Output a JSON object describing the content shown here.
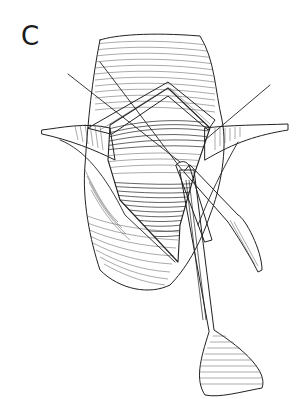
{
  "figure": {
    "panel_label": "C",
    "colors": {
      "background": "#ffffff",
      "ink": "#222222",
      "hatch": "#555555"
    }
  }
}
